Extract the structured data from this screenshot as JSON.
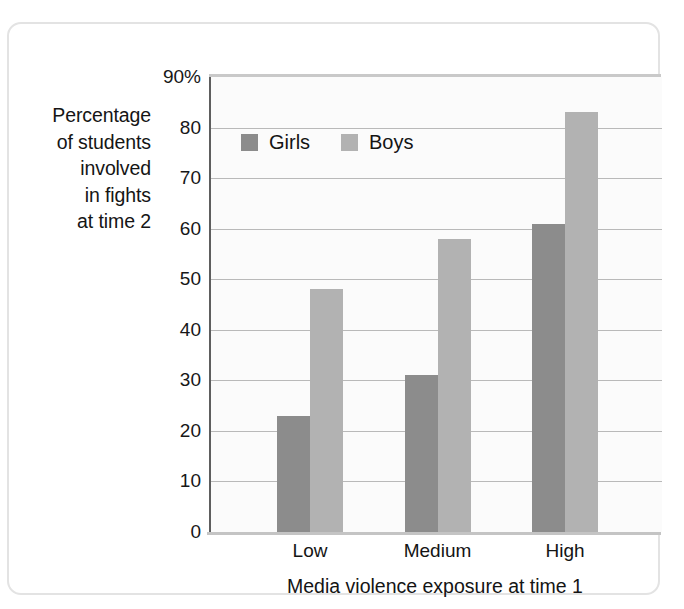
{
  "chart_data": {
    "type": "bar",
    "title": "",
    "subtitle": "",
    "categories": [
      "Low",
      "Medium",
      "High"
    ],
    "series": [
      {
        "name": "Girls",
        "values": [
          23,
          31,
          61
        ],
        "color": "#8c8c8c"
      },
      {
        "name": "Boys",
        "values": [
          48,
          58,
          83
        ],
        "color": "#b2b2b2"
      }
    ],
    "xlabel": "Media violence exposure at time 1",
    "ylabel": "Percentage of students involved in fights at time 2",
    "ylabel_lines": [
      "Percentage",
      "of students",
      "involved",
      "in fights",
      "at time 2"
    ],
    "ylim": [
      0,
      90
    ],
    "ytick_values": [
      0,
      10,
      20,
      30,
      40,
      50,
      60,
      70,
      80,
      90
    ],
    "ytick_labels": [
      "0",
      "10",
      "20",
      "30",
      "40",
      "50",
      "60",
      "70",
      "80",
      "90%"
    ],
    "grid": true,
    "grid_axis": "y",
    "legend_position": "top-left-inside",
    "legend_entries": [
      "Girls",
      "Boys"
    ],
    "background_color": "#fbfbfb",
    "gridline_color": "#b9b9b9",
    "axis_color": "#5e5e5e"
  },
  "axes": {
    "y_title_lines": [
      "Percentage",
      "of students",
      "involved",
      "in fights",
      "at time 2"
    ],
    "x_title": "Media violence exposure at time 1",
    "y_ticks": [
      "90%",
      "80",
      "70",
      "60",
      "50",
      "40",
      "30",
      "20",
      "10",
      "0"
    ],
    "x_ticks": [
      "Low",
      "Medium",
      "High"
    ]
  },
  "legend": {
    "girls_label": "Girls",
    "boys_label": "Boys"
  }
}
